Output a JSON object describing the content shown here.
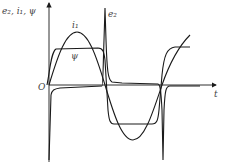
{
  "diagram": {
    "title": "",
    "axes": {
      "y_label": "e₂, i₁, ψ",
      "x_label": "t",
      "origin_label": "O"
    },
    "curves": [
      {
        "name": "i1",
        "label": "i₁",
        "description": "sinusoidal primary current"
      },
      {
        "name": "psi",
        "label": "ψ",
        "description": "flattened (saturated) flux linkage"
      },
      {
        "name": "e2",
        "label": "e₂",
        "description": "secondary EMF with sharp spikes at flux reversal"
      }
    ],
    "colors": {
      "stroke": "#1a1a1a",
      "text": "#444444",
      "background": "#ffffff"
    }
  }
}
